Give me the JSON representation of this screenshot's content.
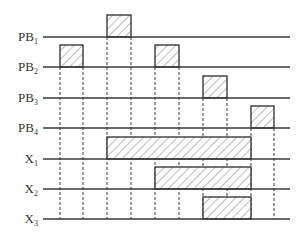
{
  "diagram": {
    "type": "timing-diagram",
    "time_slots": 10,
    "signals": [
      {
        "id": "PB1",
        "label": "PB",
        "subscript": "1",
        "high_intervals": [
          [
            2,
            3
          ]
        ]
      },
      {
        "id": "PB2",
        "label": "PB",
        "subscript": "2",
        "high_intervals": [
          [
            0,
            1
          ],
          [
            4,
            5
          ]
        ]
      },
      {
        "id": "PB3",
        "label": "PB",
        "subscript": "3",
        "high_intervals": [
          [
            6,
            7
          ]
        ]
      },
      {
        "id": "PB4",
        "label": "PB",
        "subscript": "4",
        "high_intervals": [
          [
            8,
            9
          ]
        ]
      },
      {
        "id": "X1",
        "label": "X",
        "subscript": "1",
        "high_intervals": [
          [
            2,
            8
          ]
        ]
      },
      {
        "id": "X2",
        "label": "X",
        "subscript": "2",
        "high_intervals": [
          [
            4,
            8
          ]
        ]
      },
      {
        "id": "X3",
        "label": "X",
        "subscript": "3",
        "high_intervals": [
          [
            6,
            8
          ]
        ]
      }
    ],
    "edge_guides_from": [
      {
        "edge": 0,
        "signal": "PB2"
      },
      {
        "edge": 1,
        "signal": "PB2"
      },
      {
        "edge": 2,
        "signal": "PB1"
      },
      {
        "edge": 3,
        "signal": "PB1"
      },
      {
        "edge": 4,
        "signal": "PB2"
      },
      {
        "edge": 5,
        "signal": "PB2"
      },
      {
        "edge": 6,
        "signal": "PB3"
      },
      {
        "edge": 7,
        "signal": "PB3"
      },
      {
        "edge": 8,
        "signal": "PB4"
      },
      {
        "edge": 9,
        "signal": "PB4"
      }
    ],
    "colors": {
      "line": "#3a3a3a",
      "hatch": "#6a6a6a",
      "background": "#ffffff"
    }
  }
}
